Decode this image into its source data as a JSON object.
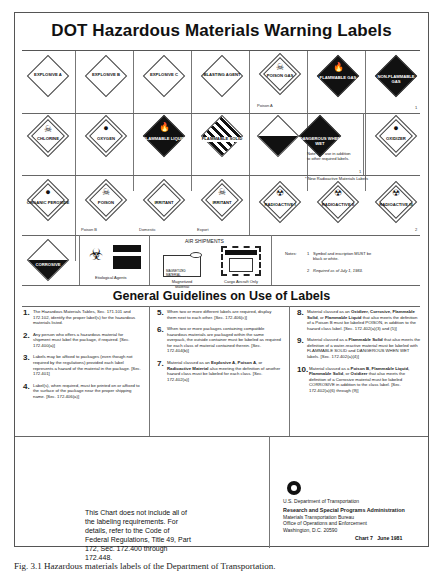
{
  "header": {
    "title": "DOT Hazardous Materials Warning Labels"
  },
  "labels_row1": [
    {
      "text": "EXPLOSIVE A",
      "class_num": "1",
      "style": "white"
    },
    {
      "text": "EXPLOSIVE B",
      "class_num": "1",
      "style": "white"
    },
    {
      "text": "EXPLOSIVE C",
      "class_num": "1",
      "style": "white"
    },
    {
      "text": "BLASTING AGENT",
      "class_num": "1",
      "style": "white"
    },
    {
      "text": "POISON GAS",
      "caption": "Poison A",
      "style": "white"
    },
    {
      "text": "FLAMMABLE GAS",
      "style": "dark"
    },
    {
      "text": "NON-FLAMMABLE GAS",
      "style": "dark"
    }
  ],
  "row1_note": "1",
  "labels_row2": [
    {
      "text": "CHLORINE",
      "style": "white"
    },
    {
      "text": "OXYGEN",
      "style": "white"
    },
    {
      "text": "FLAMMABLE LIQUID",
      "style": "dark"
    },
    {
      "text": "FLAMMABLE SOLID",
      "style": "stripe"
    },
    {
      "text": "",
      "style": "half"
    },
    {
      "text": "DANGEROUS WHEN WET",
      "style": "dark"
    },
    {
      "text": "OXIDIZER",
      "style": "white"
    }
  ],
  "row2_note": "Note:  For use in addition to other required labels.",
  "row2_note_num": "1",
  "radioactive_header": "* New Radioactive Materials Labels",
  "labels_row3": [
    {
      "text": "ORGANIC PEROXIDE",
      "style": "white"
    },
    {
      "text": "POISON",
      "caption": "Poison B",
      "style": "white"
    },
    {
      "text": "IRRITANT",
      "caption": "Domestic",
      "style": "white"
    },
    {
      "text": "IRRITANT",
      "caption": "Export",
      "style": "white"
    },
    {
      "text": "RADIOACTIVE I",
      "style": "white"
    },
    {
      "text": "RADIOACTIVE II",
      "style": "white"
    },
    {
      "text": "RADIOACTIVE III",
      "style": "white"
    }
  ],
  "row3_note": "2",
  "row4": {
    "corrosive": "CORROSIVE",
    "etiological": "Etiological Agents",
    "air_shipments": "AIR SHIPMENTS",
    "magnetized_caption": "Magnetized Material",
    "magnetized_label": "MAGNETIZED MATERIAL",
    "cargo_caption": "Cargo Aircraft Only",
    "cargo_label": "CARGO AIRCRAFT ONLY",
    "notes_label": "Notes:",
    "notes": [
      {
        "n": "1",
        "text": "Symbol and inscription MUST be black or white."
      },
      {
        "n": "2",
        "text": "Required as of July 1, 1983."
      }
    ]
  },
  "guidelines": {
    "title": "General Guidelines on Use of Labels",
    "items": [
      {
        "n": "1.",
        "text": "The Hazardous Materials Tables, Sec. 171.101 and 172.102, identify the proper label(s) for the hazardous materials listed."
      },
      {
        "n": "2.",
        "text": "Any person who offers a hazardous material for shipment must label the package, if required. [Sec. 172.400(a)]"
      },
      {
        "n": "3.",
        "text": "Labels may be affixed to packages (even though not required by the regulations) provided each label represents a hazard of the material in the package. [Sec. 172.401]"
      },
      {
        "n": "4.",
        "text": "Label(s), when required, must be printed on or affixed to the surface of the package near the proper shipping name. [Sec. 172.406(a)]"
      },
      {
        "n": "5.",
        "text": "When two or more different labels are required, display them next to each other. [Sec. 172.406(c)]"
      },
      {
        "n": "6.",
        "text": "When two or more packages containing compatible hazardous materials are packaged within the same overpack, the outside container must be labeled as required for each class of material contained therein. [Sec. 172.404(b)]"
      },
      {
        "n": "7.",
        "text_a": "Material classed as an ",
        "bold_a": "Explosive A, Poison A",
        "text_b": ", or ",
        "bold_b": "Radioactive Material",
        "text_c": " also meeting the definition of another hazard class must be labeled for each class. [Sec. 172.402(a)]"
      },
      {
        "n": "8.",
        "text_a": "Material classed as an ",
        "bold_a": "Oxidizer, Corrosive, Flammable Solid",
        "text_b": ", or ",
        "bold_b": "Flammable Liquid",
        "text_c": " that also meets the definition of a Poison B must be labeled POISON, in addition to the hazard class label. [Sec. 172.402(a)(3) and (5)]"
      },
      {
        "n": "9.",
        "text_a": "Material classed as a ",
        "bold_a": "Flammable Solid",
        "text_b": " that also meets the definition of a water-reactive material must be labeled with FLAMMABLE SOLID and DANGEROUS WHEN WET labels. [Sec. 172.402(a)(4)]"
      },
      {
        "n": "10.",
        "text_a": "Material classed as a ",
        "bold_a": "Poison B, Flammable Liquid, Flammable Solid",
        "text_b": ", or ",
        "bold_b": "Oxidizer",
        "text_c": " that also meets the definition of a Corrosive material must be labeled CORROSIVE in addition to the class label. [Sec. 172.402(a)(6) through (9)]"
      }
    ]
  },
  "footer": {
    "disclaimer": "This Chart does not include all of the labeling requirements. For details, refer to the Code of Federal Regulations, Title 49, Part 172, Sec. 172.400 through 172.448.",
    "agency": "U.S. Department of Transportation",
    "admin_bold": "Research and Special Programs Administration",
    "bureau": "Materials Transportation Bureau",
    "office": "Office of Operations and Enforcement",
    "address": "Washington, D.C. 20590",
    "chart_id": "Chart 7   June 1981"
  },
  "caption": "Fig. 3.1   Hazardous materials labels of the Department of Transportation."
}
